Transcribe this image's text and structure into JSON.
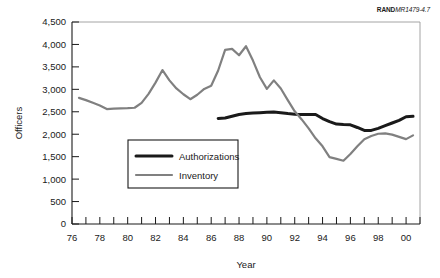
{
  "credit": {
    "brand": "RAND",
    "code": "MR1479-4.7"
  },
  "chart_data": {
    "type": "line",
    "title": "",
    "subtitle": "",
    "xlabel": "Year",
    "ylabel": "Officers",
    "xlim": [
      76,
      101
    ],
    "ylim": [
      0,
      4500
    ],
    "grid": false,
    "legend_position": "center-left-inside",
    "y_ticks": [
      0,
      500,
      1000,
      1500,
      2000,
      2500,
      3000,
      3500,
      4000,
      4500
    ],
    "y_tick_labels": [
      "0",
      "500",
      "1,000",
      "1,500",
      "2,000",
      "2,500",
      "3,000",
      "3,500",
      "4,000",
      "4,500"
    ],
    "x_ticks": [
      76,
      77,
      78,
      79,
      80,
      81,
      82,
      83,
      84,
      85,
      86,
      87,
      88,
      89,
      90,
      91,
      92,
      93,
      94,
      95,
      96,
      97,
      98,
      99,
      100,
      101
    ],
    "x_tick_labels": [
      "76",
      "",
      "78",
      "",
      "80",
      "",
      "82",
      "",
      "84",
      "",
      "86",
      "",
      "88",
      "",
      "90",
      "",
      "92",
      "",
      "94",
      "",
      "96",
      "",
      "98",
      "",
      "00",
      ""
    ],
    "series": [
      {
        "name": "Authorizations",
        "color": "#1a1a1a",
        "width": 3.0,
        "x": [
          86.5,
          87.0,
          87.5,
          88.0,
          88.5,
          89.0,
          89.5,
          90.0,
          90.5,
          91.0,
          91.5,
          92.0,
          92.5,
          93.0,
          93.5,
          94.0,
          94.5,
          95.0,
          95.5,
          96.0,
          96.5,
          97.0,
          97.5,
          98.0,
          98.5,
          99.0,
          99.5,
          100.0,
          100.5
        ],
        "values": [
          2350,
          2360,
          2400,
          2440,
          2460,
          2470,
          2480,
          2490,
          2495,
          2480,
          2460,
          2445,
          2440,
          2440,
          2440,
          2350,
          2280,
          2225,
          2215,
          2210,
          2150,
          2085,
          2085,
          2130,
          2190,
          2250,
          2310,
          2390,
          2400
        ]
      },
      {
        "name": "Inventory",
        "color": "#808080",
        "width": 2.2,
        "x": [
          76.5,
          77.0,
          77.5,
          78.0,
          78.5,
          79.0,
          79.5,
          80.0,
          80.5,
          81.0,
          81.5,
          82.0,
          82.5,
          83.0,
          83.5,
          84.0,
          84.5,
          85.0,
          85.5,
          86.0,
          86.5,
          87.0,
          87.5,
          88.0,
          88.5,
          89.0,
          89.5,
          90.0,
          90.5,
          91.0,
          91.5,
          92.0,
          92.5,
          93.0,
          93.5,
          94.0,
          94.5,
          95.0,
          95.5,
          96.0,
          96.5,
          97.0,
          97.5,
          98.0,
          98.5,
          99.0,
          99.5,
          100.0,
          100.5
        ],
        "values": [
          2810,
          2760,
          2700,
          2640,
          2560,
          2570,
          2575,
          2580,
          2590,
          2700,
          2900,
          3150,
          3430,
          3200,
          3020,
          2890,
          2780,
          2880,
          3010,
          3080,
          3420,
          3880,
          3900,
          3760,
          3960,
          3640,
          3270,
          3010,
          3200,
          3020,
          2760,
          2510,
          2330,
          2130,
          1910,
          1730,
          1490,
          1450,
          1410,
          1560,
          1730,
          1890,
          1960,
          2010,
          2020,
          1990,
          1940,
          1890,
          1975
        ]
      }
    ]
  }
}
